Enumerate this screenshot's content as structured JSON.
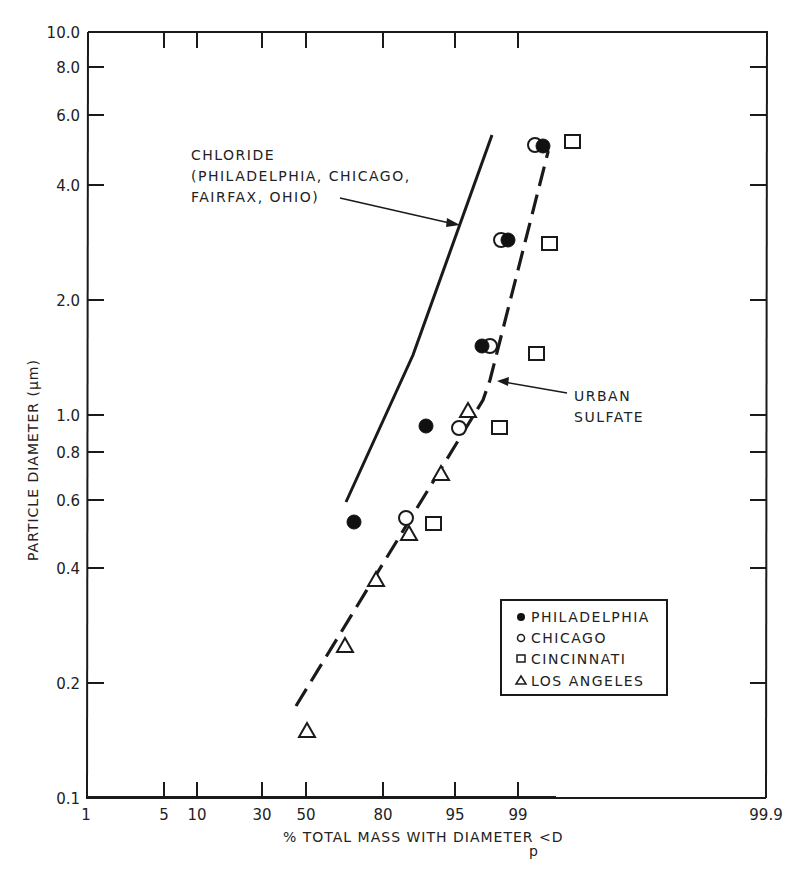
{
  "chart_data": {
    "type": "scatter",
    "title": "",
    "xlabel": "% TOTAL MASS WITH DIAMETER <D",
    "xlabel_subscript": "p",
    "ylabel": "PARTICLE DIAMETER (μm)",
    "x_scale": "probability",
    "y_scale": "log",
    "xlim": [
      1,
      99.9
    ],
    "ylim": [
      0.1,
      10.0
    ],
    "grid": false,
    "legend_position": "lower right",
    "x_ticks": [
      "1",
      "5",
      "10",
      "30",
      "50",
      "80",
      "95",
      "99",
      "99.9"
    ],
    "y_ticks": [
      "10.0",
      "8.0",
      "6.0",
      "4.0",
      "2.0",
      "1.0",
      "0.8",
      "0.6",
      "0.4",
      "0.2",
      "0.1"
    ],
    "series": [
      {
        "name": "PHILADELPHIA",
        "marker": "filled-circle",
        "points": [
          [
            92,
            5.0
          ],
          [
            84,
            3.0
          ],
          [
            79,
            1.5
          ],
          [
            64,
            0.92
          ],
          [
            43,
            0.52
          ]
        ]
      },
      {
        "name": "CHICAGO",
        "marker": "open-circle",
        "points": [
          [
            90,
            5.0
          ],
          [
            83,
            3.0
          ],
          [
            80,
            1.5
          ],
          [
            75,
            0.9
          ],
          [
            59,
            0.53
          ]
        ]
      },
      {
        "name": "CINCINNATI",
        "marker": "open-square",
        "points": [
          [
            94,
            5.1
          ],
          [
            93,
            2.8
          ],
          [
            91,
            1.45
          ],
          [
            84,
            0.92
          ],
          [
            66,
            0.51
          ]
        ]
      },
      {
        "name": "LOS ANGELES",
        "marker": "open-triangle",
        "points": [
          [
            77,
            1.0
          ],
          [
            70,
            0.7
          ],
          [
            59,
            0.48
          ],
          [
            50,
            0.38
          ],
          [
            40,
            0.25
          ],
          [
            29,
            0.15
          ]
        ]
      }
    ],
    "lines": [
      {
        "name": "CHLORIDE",
        "style": "solid",
        "points": [
          [
            41,
            0.6
          ],
          [
            62,
            1.4
          ],
          [
            80,
            5.5
          ]
        ]
      },
      {
        "name": "URBAN SULFATE",
        "style": "dashed",
        "points": [
          [
            26,
            0.17
          ],
          [
            80,
            1.1
          ],
          [
            83,
            1.3
          ],
          [
            92,
            4.9
          ]
        ]
      }
    ],
    "annotations": [
      {
        "text": "CHLORIDE\n(PHILADELPHIA, CHICAGO,\nFAIRFAX, OHIO)",
        "arrow_to": "CHLORIDE line"
      },
      {
        "text": "URBAN\nSULFATE",
        "arrow_to": "URBAN SULFATE line"
      }
    ]
  },
  "axes": {
    "y_title": "PARTICLE DIAMETER (μm)",
    "x_title": "% TOTAL MASS WITH DIAMETER <D",
    "x_title_sub": "p",
    "y_ticks": [
      {
        "label": "10.0",
        "y": 32
      },
      {
        "label": "8.0",
        "y": 67
      },
      {
        "label": "6.0",
        "y": 115
      },
      {
        "label": "4.0",
        "y": 185
      },
      {
        "label": "2.0",
        "y": 300
      },
      {
        "label": "1.0",
        "y": 415
      },
      {
        "label": "0.8",
        "y": 452
      },
      {
        "label": "0.6",
        "y": 500
      },
      {
        "label": "0.4",
        "y": 568
      },
      {
        "label": "0.2",
        "y": 683
      },
      {
        "label": "0.1",
        "y": 798
      }
    ],
    "x_ticks": [
      {
        "label": "1",
        "x": 86
      },
      {
        "label": "5",
        "x": 144
      },
      {
        "label": "10",
        "x": 177
      },
      {
        "label": "30",
        "x": 242
      },
      {
        "label": "50",
        "x": 282
      },
      {
        "label": "80",
        "x": 359
      },
      {
        "label": "95",
        "x": 429
      },
      {
        "label": "99",
        "x": 488
      },
      {
        "label": "99.9",
        "x": 555
      }
    ]
  },
  "annotations": {
    "chloride": [
      "CHLORIDE",
      "(PHILADELPHIA, CHICAGO,",
      "FAIRFAX, OHIO)"
    ],
    "sulfate": [
      "URBAN",
      "SULFATE"
    ]
  },
  "legend": {
    "items": [
      {
        "label": "PHILADELPHIA",
        "marker": "filled-circle"
      },
      {
        "label": "CHICAGO",
        "marker": "open-circle"
      },
      {
        "label": "CINCINNATI",
        "marker": "open-square"
      },
      {
        "label": "LOS ANGELES",
        "marker": "open-triangle"
      }
    ]
  },
  "colors": {
    "ink": "#1a1a1a",
    "background": "#ffffff"
  }
}
